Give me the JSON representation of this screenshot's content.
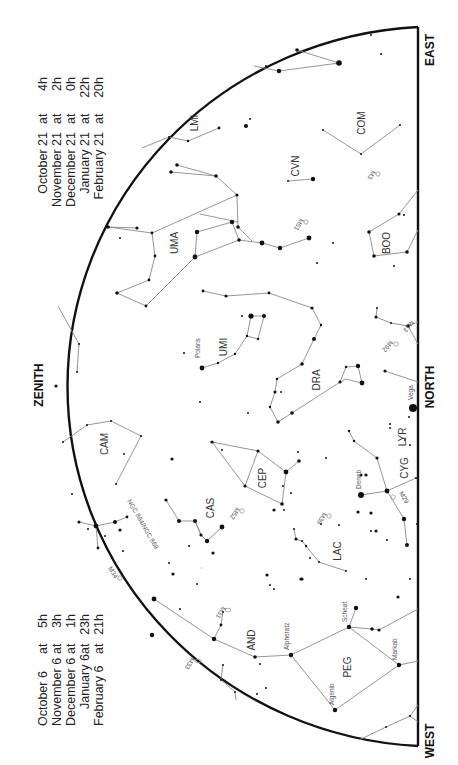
{
  "chart": {
    "directions": {
      "east": "EAST",
      "west": "WEST",
      "north": "NORTH",
      "zenith": "ZENITH"
    },
    "time_table_east": [
      {
        "date": "October 21",
        "at": "at",
        "time": "4h"
      },
      {
        "date": "November 21",
        "at": "at",
        "time": "2h"
      },
      {
        "date": "December 21",
        "at": "at",
        "time": "0h"
      },
      {
        "date": "January 21",
        "at": "at",
        "time": "22h"
      },
      {
        "date": "February 21",
        "at": "at",
        "time": "20h"
      }
    ],
    "time_table_west": [
      {
        "date": "October 6",
        "at": "at",
        "time": "5h"
      },
      {
        "date": "November 6",
        "at": "at",
        "time": "3h"
      },
      {
        "date": "December 6",
        "at": "at",
        "time": "1h"
      },
      {
        "date": "January 6",
        "at": "at",
        "time": "23h"
      },
      {
        "date": "February 6",
        "at": "at",
        "time": "21h"
      }
    ],
    "constellations": [
      "LMI",
      "COM",
      "CVN",
      "UMA",
      "BOO",
      "UMI",
      "DRA",
      "CAM",
      "CEP",
      "CAS",
      "LYR",
      "CYG",
      "LAC",
      "AND",
      "PEG"
    ],
    "stars": [
      "Polaris",
      "Vega",
      "Deneb",
      "Alpheratz",
      "Scheat",
      "Markab",
      "Algenib"
    ],
    "deep_sky": [
      "M3",
      "M51",
      "M13",
      "M92",
      "M52",
      "M39",
      "M29",
      "NGC 884/NGC 869",
      "M34",
      "M31",
      "M33"
    ],
    "colors": {
      "horizon": "#111111",
      "lines": "#8a8a8a",
      "stars": "#111111"
    }
  }
}
